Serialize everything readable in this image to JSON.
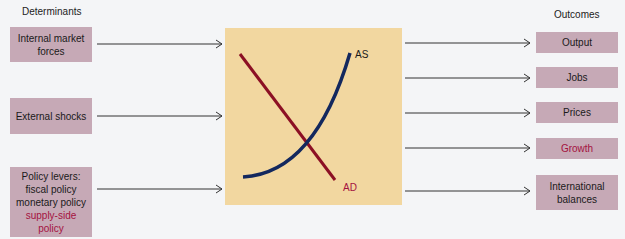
{
  "headers": {
    "left": "Determinants",
    "right": "Outcomes"
  },
  "determinants": [
    {
      "lines": [
        "Internal market",
        "forces"
      ]
    },
    {
      "lines": [
        "External shocks"
      ]
    },
    {
      "lines": [
        "Policy levers:",
        "fiscal policy",
        "monetary policy"
      ],
      "highlight_lines": [
        "supply-side",
        "policy"
      ]
    }
  ],
  "outcomes": [
    {
      "label": "Output"
    },
    {
      "label": "Jobs"
    },
    {
      "label": "Prices"
    },
    {
      "label": "Growth",
      "highlight": true
    },
    {
      "lines": [
        "International",
        "balances"
      ]
    }
  ],
  "chart": {
    "as_label": "AS",
    "ad_label": "AD"
  },
  "colors": {
    "box": "#c6a9b6",
    "chart_bg": "#f2d7a0",
    "as_curve": "#13285e",
    "ad_curve": "#8c1024",
    "highlight_text": "#a4123f"
  }
}
